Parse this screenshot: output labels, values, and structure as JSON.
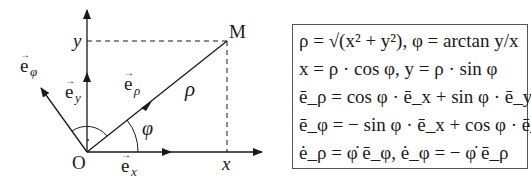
{
  "diagram": {
    "labels": {
      "origin": "O",
      "point": "M",
      "x_axis_tick": "x",
      "y_axis_tick": "y",
      "radius": "ρ",
      "angle": "φ",
      "e_x": "e",
      "e_x_sub": "x",
      "e_y": "e",
      "e_y_sub": "y",
      "e_rho": "e",
      "e_rho_sub": "ρ",
      "e_phi": "e",
      "e_phi_sub": "φ"
    },
    "colors": {
      "stroke": "#1a1a1a",
      "box_border": "#555555"
    }
  },
  "formulas": [
    "ρ = √(x² + y²),  φ = arctan y/x",
    "x = ρ · cos φ,  y = ρ · sin φ",
    "ē_ρ = cos φ · ē_x + sin φ · ē_y,",
    "ē_φ = − sin φ · ē_x + cos φ · ē_y",
    "ė_ρ = φ̇ ē_φ,  ė_φ = − φ̇ ē_ρ"
  ]
}
